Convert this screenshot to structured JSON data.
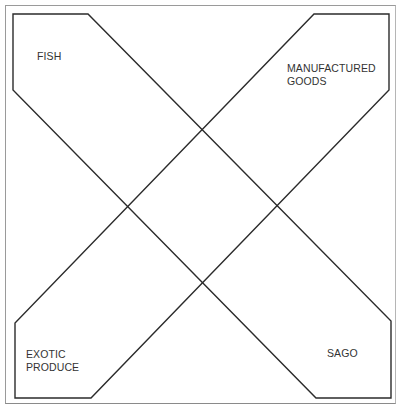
{
  "diagram": {
    "type": "crossed-bands",
    "stroke_color": "#2b2b2b",
    "frame_color": "#9a9a9a",
    "regions": [
      {
        "id": "fish",
        "lines": [
          "FISH"
        ],
        "corner": "top-left"
      },
      {
        "id": "manufactured-goods",
        "lines": [
          "MANUFACTURED",
          "GOODS"
        ],
        "corner": "top-right"
      },
      {
        "id": "exotic-produce",
        "lines": [
          "EXOTIC",
          "PRODUCE"
        ],
        "corner": "bottom-left"
      },
      {
        "id": "sago",
        "lines": [
          "SAGO"
        ],
        "corner": "bottom-right"
      }
    ],
    "bands": [
      {
        "id": "fish-to-sago",
        "from": "fish",
        "to": "sago"
      },
      {
        "id": "manufactured-to-exotic",
        "from": "manufactured-goods",
        "to": "exotic-produce"
      }
    ]
  }
}
